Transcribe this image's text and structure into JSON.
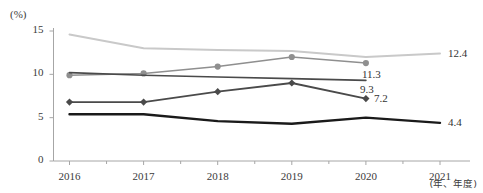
{
  "chart_data": {
    "type": "line",
    "title": "",
    "subtitle": "",
    "xlabel": "(年、年度)",
    "ylabel": "(%)",
    "x": [
      "2016",
      "2017",
      "2018",
      "2019",
      "2020",
      "2021"
    ],
    "xlim": [
      "2016",
      "2021"
    ],
    "ylim": [
      0,
      15
    ],
    "yticks": [
      "0",
      "5",
      "10",
      "15"
    ],
    "grid": false,
    "legend": "none",
    "series": [
      {
        "name": "series-lightest-gray",
        "color": "#c9c9c9",
        "marker": "none",
        "width": 2.0,
        "x": [
          "2016",
          "2017",
          "2018",
          "2019",
          "2020",
          "2021"
        ],
        "values": [
          14.6,
          13.0,
          12.8,
          12.7,
          12.0,
          12.4
        ],
        "end_label": "12.4"
      },
      {
        "name": "series-medium-gray-round-marker",
        "color": "#8f8f8f",
        "marker": "circle",
        "width": 1.6,
        "x": [
          "2016",
          "2017",
          "2018",
          "2019",
          "2020"
        ],
        "values": [
          9.9,
          10.1,
          10.9,
          12.0,
          11.3
        ],
        "end_label": "11.3"
      },
      {
        "name": "series-dark-gray-thin",
        "color": "#4a4a4a",
        "marker": "none",
        "width": 1.6,
        "x": [
          "2016",
          "2017",
          "2018",
          "2019",
          "2020"
        ],
        "values": [
          10.2,
          9.9,
          9.7,
          9.5,
          9.3
        ],
        "end_label": "9.3"
      },
      {
        "name": "series-dark-diamond-marker",
        "color": "#4a4a4a",
        "marker": "diamond",
        "width": 1.8,
        "x": [
          "2016",
          "2017",
          "2018",
          "2019",
          "2020"
        ],
        "values": [
          6.8,
          6.8,
          8.0,
          9.0,
          7.2
        ],
        "end_label": "7.2"
      },
      {
        "name": "series-black-thick",
        "color": "#1a1a1a",
        "marker": "none",
        "width": 2.4,
        "x": [
          "2016",
          "2017",
          "2018",
          "2019",
          "2020",
          "2021"
        ],
        "values": [
          5.4,
          5.4,
          4.6,
          4.3,
          5.0,
          4.4
        ],
        "end_label": "4.4"
      }
    ],
    "data_labels": [
      {
        "text": "12.4",
        "series": "series-lightest-gray",
        "x": "2021",
        "value": 12.4
      },
      {
        "text": "11.3",
        "series": "series-medium-gray-round-marker",
        "x": "2020",
        "value": 11.3
      },
      {
        "text": "9.3",
        "series": "series-dark-gray-thin",
        "x": "2020",
        "value": 9.3
      },
      {
        "text": "7.2",
        "series": "series-dark-diamond-marker",
        "x": "2020",
        "value": 7.2
      },
      {
        "text": "4.4",
        "series": "series-black-thick",
        "x": "2021",
        "value": 4.4
      }
    ]
  },
  "axes": {
    "unit_label": "(%)",
    "y_ticks": [
      "15",
      "10",
      "5",
      "0"
    ],
    "x_ticks": [
      "2016",
      "2017",
      "2018",
      "2019",
      "2020",
      "2021"
    ],
    "x_caption": "(年、年度)"
  },
  "colors": {
    "axis": "#a6a6a6",
    "tick_text": "#3b3b3b",
    "label_text": "#333333",
    "background": "#ffffff"
  }
}
